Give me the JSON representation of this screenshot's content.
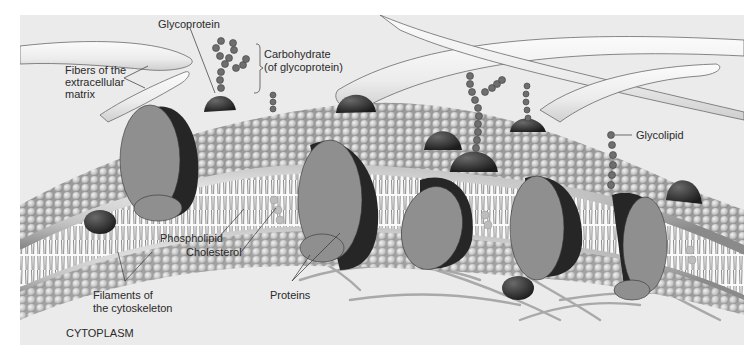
{
  "figure": {
    "colors": {
      "background": "#ebebeb",
      "border": "#ffffff",
      "phospholipid_head": "#c8c8c8",
      "phospholipid_head_shadow": "#8e8e8e",
      "tail": "#555555",
      "protein_face": "#8f8f8f",
      "protein_dark": "#262626",
      "peripheral_protein": "#3a3a3a",
      "carbohydrate": "#6e6e6e",
      "fiber": "#f4f4f4",
      "fiber_outline": "#6a6a6a",
      "filament": "#a9a9a9",
      "cholesterol": "#bdbdbd",
      "label_text": "#2a2a2a"
    }
  },
  "labels": {
    "glycoprotein": "Glycoprotein",
    "carbohydrate": "Carbohydrate\n(of glycoprotein)",
    "fibers": "Fibers of the\nextracellular\nmatrix",
    "glycolipid": "Glycolipid",
    "phospholipid": "Phospholipid",
    "cholesterol": "Cholesterol",
    "filaments": "Filaments of\nthe cytoskeleton",
    "proteins": "Proteins",
    "cytoplasm": "CYTOPLASM"
  }
}
